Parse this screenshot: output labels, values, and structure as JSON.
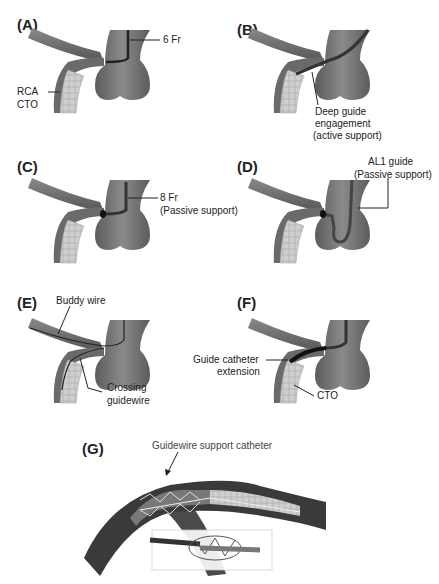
{
  "figure": {
    "panels": [
      {
        "id": "A",
        "label": "(A)",
        "annotations": [
          "6 Fr",
          "RCA",
          "CTO"
        ]
      },
      {
        "id": "B",
        "label": "(B)",
        "annotations": [
          "Deep guide",
          "engagement",
          "(active support)"
        ]
      },
      {
        "id": "C",
        "label": "(C)",
        "annotations": [
          "8 Fr",
          "(Passive support)"
        ]
      },
      {
        "id": "D",
        "label": "(D)",
        "annotations": [
          "AL1 guide",
          "(Passive support)"
        ]
      },
      {
        "id": "E",
        "label": "(E)",
        "annotations": [
          "Buddy wire",
          "Crossing",
          "guidewire"
        ]
      },
      {
        "id": "F",
        "label": "(F)",
        "annotations": [
          "Guide catheter",
          "extension",
          "CTO"
        ]
      },
      {
        "id": "G",
        "label": "(G)",
        "annotations": [
          "Guidewire support catheter"
        ]
      }
    ],
    "colors": {
      "vessel": "#6e6e6e",
      "vessel_dark": "#4a4a4a",
      "aorta": "#7a7a7a",
      "cto": "#c8c8c8",
      "text": "#222222"
    }
  }
}
